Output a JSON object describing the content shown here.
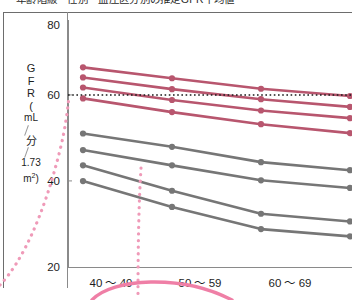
{
  "caption": {
    "text": "年齢階級・性別・血圧区分別の推定GFR平均値"
  },
  "axes": {
    "y_title_lines": [
      "G",
      "F",
      "R",
      "(",
      "mL",
      "分",
      "1.73",
      "m"
    ],
    "y_title_sup": "2",
    "y_ticks": [
      80,
      60,
      40,
      20
    ],
    "y_min": 20,
    "y_max": 80,
    "x_categories": [
      "40 〜 49",
      "50 〜 59",
      "60 〜 69"
    ],
    "reference_line_value": 60
  },
  "colors": {
    "red": "#b8566e",
    "gray": "#767676",
    "pink_annotation": "#ef9ab8",
    "axis": "#8a8a8a",
    "reference": "#1a1a1a",
    "text": "#1d1d1d",
    "background": "#ffffff"
  },
  "chart_data": {
    "type": "line",
    "title": "年齢階級・性別・血圧区分別の推定GFR平均値",
    "xlabel": "",
    "ylabel": "GFR (mL/分/1.73 m²)",
    "categories": [
      "40 〜 49",
      "50 〜 59",
      "60 〜 69",
      ""
    ],
    "ylim": [
      20,
      80
    ],
    "xlim": [
      0,
      3.4
    ],
    "grid": false,
    "legend": "none",
    "reference_lines": [
      {
        "axis": "y",
        "value": 60,
        "style": "dotted",
        "color": "#1a1a1a"
      }
    ],
    "series": [
      {
        "name": "red-1",
        "color": "#b8566e",
        "values": [
          69.5,
          66.8,
          64.2,
          62.4
        ]
      },
      {
        "name": "red-2",
        "color": "#b8566e",
        "values": [
          67.0,
          64.1,
          61.6,
          59.7
        ]
      },
      {
        "name": "red-3",
        "color": "#b8566e",
        "values": [
          64.5,
          61.4,
          58.8,
          56.9
        ]
      },
      {
        "name": "red-4",
        "color": "#b8566e",
        "values": [
          61.8,
          58.4,
          55.4,
          53.2
        ]
      },
      {
        "name": "gray-1",
        "color": "#767676",
        "values": [
          53.1,
          49.8,
          46.0,
          44.0
        ]
      },
      {
        "name": "gray-2",
        "color": "#767676",
        "values": [
          49.0,
          45.2,
          41.5,
          39.6
        ]
      },
      {
        "name": "gray-3",
        "color": "#767676",
        "values": [
          45.2,
          38.9,
          33.2,
          31.3
        ]
      },
      {
        "name": "gray-4",
        "color": "#767676",
        "values": [
          41.3,
          34.9,
          29.4,
          27.6
        ]
      }
    ],
    "annotations": [
      {
        "name": "pink-dotted-rising-curve",
        "color": "#ef9ab8",
        "style": "dotted"
      },
      {
        "name": "pink-dotted-falling-curve",
        "color": "#ef9ab8",
        "style": "dotted"
      },
      {
        "name": "pink-arc-underline",
        "color": "#ef7fa6",
        "style": "solid"
      }
    ]
  }
}
